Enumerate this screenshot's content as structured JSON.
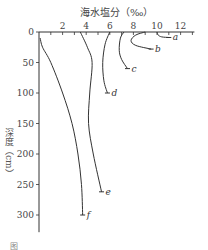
{
  "chart_data": {
    "type": "line",
    "title": "海水塩分（‰）",
    "xlabel": "海水塩分（‰）",
    "ylabel": "深度（cm）",
    "xlim": [
      0,
      13
    ],
    "ylim": [
      0,
      320
    ],
    "y_inverted": true,
    "x_axis_position": "top",
    "x_ticks": [
      0,
      2,
      4,
      6,
      8,
      10,
      12
    ],
    "y_ticks": [
      0,
      50,
      100,
      150,
      200,
      250,
      300
    ],
    "grid": false,
    "series": [
      {
        "name": "a",
        "points": [
          [
            10.0,
            0
          ],
          [
            10.1,
            5
          ],
          [
            10.4,
            8
          ],
          [
            11.0,
            9
          ]
        ]
      },
      {
        "name": "b",
        "points": [
          [
            9.0,
            0
          ],
          [
            8.2,
            5
          ],
          [
            7.8,
            14
          ],
          [
            8.2,
            22
          ],
          [
            9.5,
            28
          ]
        ]
      },
      {
        "name": "c",
        "points": [
          [
            7.2,
            0
          ],
          [
            6.9,
            10
          ],
          [
            6.8,
            30
          ],
          [
            7.0,
            45
          ],
          [
            7.5,
            60
          ]
        ]
      },
      {
        "name": "d",
        "points": [
          [
            6.0,
            0
          ],
          [
            5.6,
            20
          ],
          [
            5.4,
            50
          ],
          [
            5.5,
            80
          ],
          [
            5.8,
            100
          ]
        ]
      },
      {
        "name": "e",
        "points": [
          [
            3.5,
            0
          ],
          [
            4.1,
            25
          ],
          [
            4.5,
            50
          ],
          [
            4.3,
            100
          ],
          [
            4.2,
            150
          ],
          [
            4.6,
            200
          ],
          [
            5.3,
            262
          ]
        ]
      },
      {
        "name": "f",
        "points": [
          [
            0.1,
            10
          ],
          [
            0.3,
            25
          ],
          [
            1.0,
            50
          ],
          [
            2.0,
            100
          ],
          [
            2.8,
            150
          ],
          [
            3.3,
            200
          ],
          [
            3.6,
            250
          ],
          [
            3.7,
            300
          ]
        ]
      }
    ]
  },
  "labels": {
    "title": "海水塩分（‰）",
    "ylabel": "深度（cm）",
    "caption": "图"
  }
}
